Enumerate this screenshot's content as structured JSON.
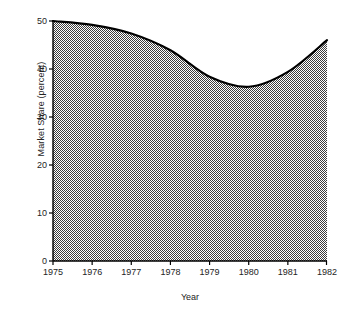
{
  "chart_data": {
    "type": "area",
    "title": "",
    "xlabel": "Year",
    "ylabel": "Market Share (percent)",
    "x": [
      1975,
      1976,
      1977,
      1978,
      1979,
      1980,
      1981,
      1982
    ],
    "categories": [
      "1975",
      "1976",
      "1977",
      "1978",
      "1979",
      "1980",
      "1981",
      "1982"
    ],
    "values": [
      50.0,
      49.2,
      47.4,
      43.9,
      38.4,
      36.3,
      39.4,
      46.0
    ],
    "series": [
      {
        "name": "Market Share",
        "values": [
          50.0,
          49.2,
          47.4,
          43.9,
          38.4,
          36.3,
          39.4,
          46.0
        ]
      }
    ],
    "xlim": [
      1975,
      1982
    ],
    "ylim": [
      0,
      50
    ],
    "yticks": [
      0,
      10,
      20,
      30,
      40,
      50
    ],
    "ytick_labels": [
      "0",
      "10",
      "20",
      "30",
      "40",
      "50"
    ],
    "xticks": [
      1975,
      1976,
      1977,
      1978,
      1979,
      1980,
      1981,
      1982
    ],
    "xtick_labels": [
      "1975",
      "1976",
      "1977",
      "1978",
      "1979",
      "1980",
      "1981",
      "1982"
    ],
    "grid": false,
    "legend": "none",
    "fill_pattern": "50-percent-checkerboard-dither",
    "fill_color": "#808080",
    "line_color": "#000000",
    "line_width": 2.2,
    "axis_color": "#000000",
    "background_color": "#ffffff"
  }
}
